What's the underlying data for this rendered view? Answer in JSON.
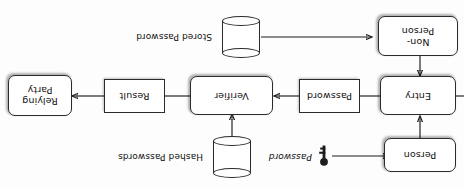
{
  "diagram": {
    "orientation": "rotated-180",
    "background_color": "#fdfdfd",
    "stroke_color": "#1d1d1d",
    "nodes": [
      {
        "id": "person",
        "label": "Person",
        "shape": "rounded-rect"
      },
      {
        "id": "non_person",
        "label": "Non-\nPerson",
        "shape": "rounded-rect"
      },
      {
        "id": "entry",
        "label": "Entry",
        "shape": "rounded-rect"
      },
      {
        "id": "password",
        "label": "Password",
        "shape": "rect"
      },
      {
        "id": "verifier",
        "label": "Verifier",
        "shape": "rounded-rect"
      },
      {
        "id": "result",
        "label": "Result",
        "shape": "rect"
      },
      {
        "id": "relying_party",
        "label": "Relying\nParty",
        "shape": "rounded-rect"
      }
    ],
    "datastores": [
      {
        "id": "hashed_passwords",
        "label": "Hashed Passwords",
        "shape": "cylinder"
      },
      {
        "id": "stored_password",
        "label": "Stored Password",
        "shape": "cylinder"
      }
    ],
    "edge_labels": [
      {
        "id": "password_input",
        "label": "Password",
        "icon": "key-icon"
      }
    ],
    "edges": [
      {
        "from": "password_input",
        "to": "person"
      },
      {
        "from": "person",
        "to": "entry"
      },
      {
        "from": "stored_password",
        "to": "non_person"
      },
      {
        "from": "non_person",
        "to": "entry"
      },
      {
        "from": "entry",
        "to": "password"
      },
      {
        "from": "password",
        "to": "verifier"
      },
      {
        "from": "hashed_passwords",
        "to": "verifier"
      },
      {
        "from": "verifier",
        "to": "result"
      },
      {
        "from": "result",
        "to": "relying_party"
      }
    ]
  },
  "labels": {
    "person": "Person",
    "non_person_line1": "Non-",
    "non_person_line2": "Person",
    "entry": "Entry",
    "password_box": "Password",
    "verifier": "Verifier",
    "result": "Result",
    "relying_party_line1": "Relying",
    "relying_party_line2": "Party",
    "hashed_passwords": "Hashed Passwords",
    "stored_password": "Stored Password",
    "password_edge": "Password"
  }
}
